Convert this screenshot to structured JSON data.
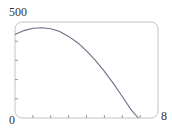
{
  "chart_data": {
    "type": "line",
    "title": "",
    "xlabel": "",
    "ylabel": "",
    "xlim": [
      0,
      8
    ],
    "ylim": [
      0,
      500
    ],
    "x_tick_labels": [
      "0",
      "8"
    ],
    "y_tick_labels": [
      "500"
    ],
    "x_ticks": [
      1,
      2,
      3,
      4,
      5,
      6,
      7
    ],
    "y_ticks": [
      100,
      200,
      300,
      400
    ],
    "grid": false,
    "series": [
      {
        "name": "curve",
        "color": "#6d6d8a",
        "x": [
          0,
          0.5,
          1.0,
          1.5,
          2.0,
          2.5,
          3.0,
          3.5,
          4.0,
          4.5,
          5.0,
          5.5,
          6.0,
          6.5,
          6.9
        ],
        "y": [
          435,
          455,
          467,
          470,
          465,
          450,
          425,
          392,
          350,
          300,
          243,
          180,
          112,
          42,
          0
        ]
      }
    ]
  },
  "labels": {
    "y_max": "500",
    "x_min": "0",
    "x_max": "8"
  },
  "colors": {
    "frame": "#bdbdbd",
    "axis": "#9a9a9a",
    "curve": "#6d6d8a"
  }
}
